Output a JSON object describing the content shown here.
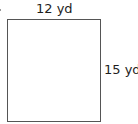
{
  "diagram": {
    "shape": "rectangle",
    "width_label": "12 yd",
    "height_label": "15 yd",
    "colors": {
      "stroke": "#555555",
      "text": "#1e1e1e",
      "background": "#ffffff"
    }
  }
}
